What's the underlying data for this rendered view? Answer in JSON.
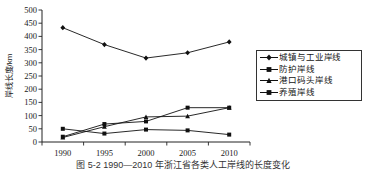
{
  "caption": "图 5-2  1990—2010 年浙江省各类人工岸线的长度变化",
  "legend": {
    "items": [
      {
        "label": "城镇与工业岸线",
        "marker": "diamond-marker"
      },
      {
        "label": "防护岸线",
        "marker": "square-marker"
      },
      {
        "label": "港口码头岸线",
        "marker": "triangle-marker"
      },
      {
        "label": "养殖岸线",
        "marker": "square-marker"
      }
    ]
  },
  "chart_data": {
    "type": "line",
    "title": "",
    "xlabel": "",
    "ylabel": "岸线长度/km",
    "categories": [
      "1990",
      "1995",
      "2000",
      "2005",
      "2010"
    ],
    "x_ticks": [
      "1990",
      "1995",
      "2000",
      "2005",
      "2010"
    ],
    "y_ticks": [
      "0",
      "50",
      "100",
      "150",
      "200",
      "250",
      "300",
      "350",
      "400",
      "450",
      "500"
    ],
    "ylim": [
      0,
      500
    ],
    "grid": false,
    "legend_position": "right",
    "series": [
      {
        "name": "城镇与工业岸线",
        "marker": "diamond",
        "values": [
          433,
          369,
          318,
          338,
          379
        ]
      },
      {
        "name": "防护岸线",
        "marker": "square",
        "values": [
          20,
          68,
          78,
          130,
          130
        ]
      },
      {
        "name": "港口码头岸线",
        "marker": "triangle",
        "values": [
          17,
          58,
          95,
          98,
          130
        ]
      },
      {
        "name": "养殖岸线",
        "marker": "square",
        "values": [
          50,
          32,
          47,
          44,
          28
        ]
      }
    ]
  }
}
